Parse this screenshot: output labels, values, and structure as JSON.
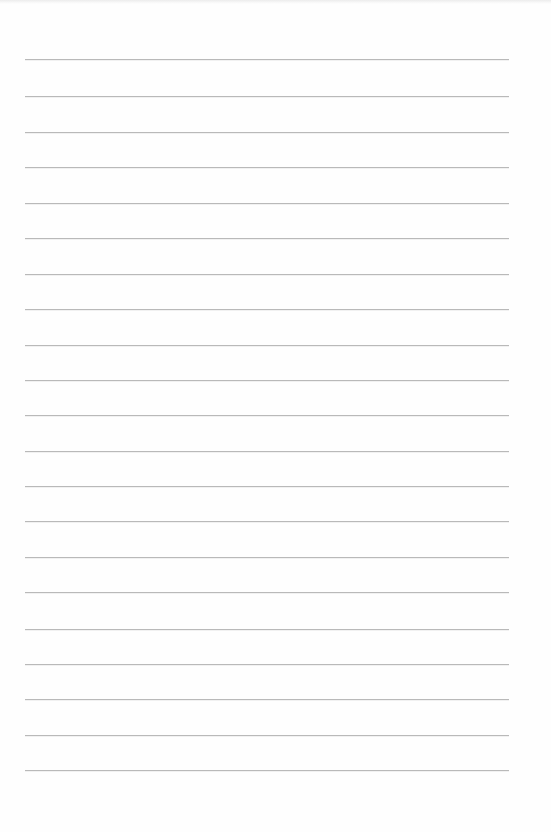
{
  "page": {
    "type": "lined-paper",
    "width": 551,
    "height": 832,
    "background_color": "#fefefe",
    "line_color": "#b9b9b9",
    "line_left": 25,
    "line_right": 509,
    "line_count": 21,
    "line_positions": [
      59,
      96,
      132,
      167,
      203,
      238,
      274,
      309,
      345,
      380,
      415,
      451,
      486,
      521,
      557,
      592,
      629,
      664,
      699,
      735,
      770
    ],
    "text": ""
  }
}
